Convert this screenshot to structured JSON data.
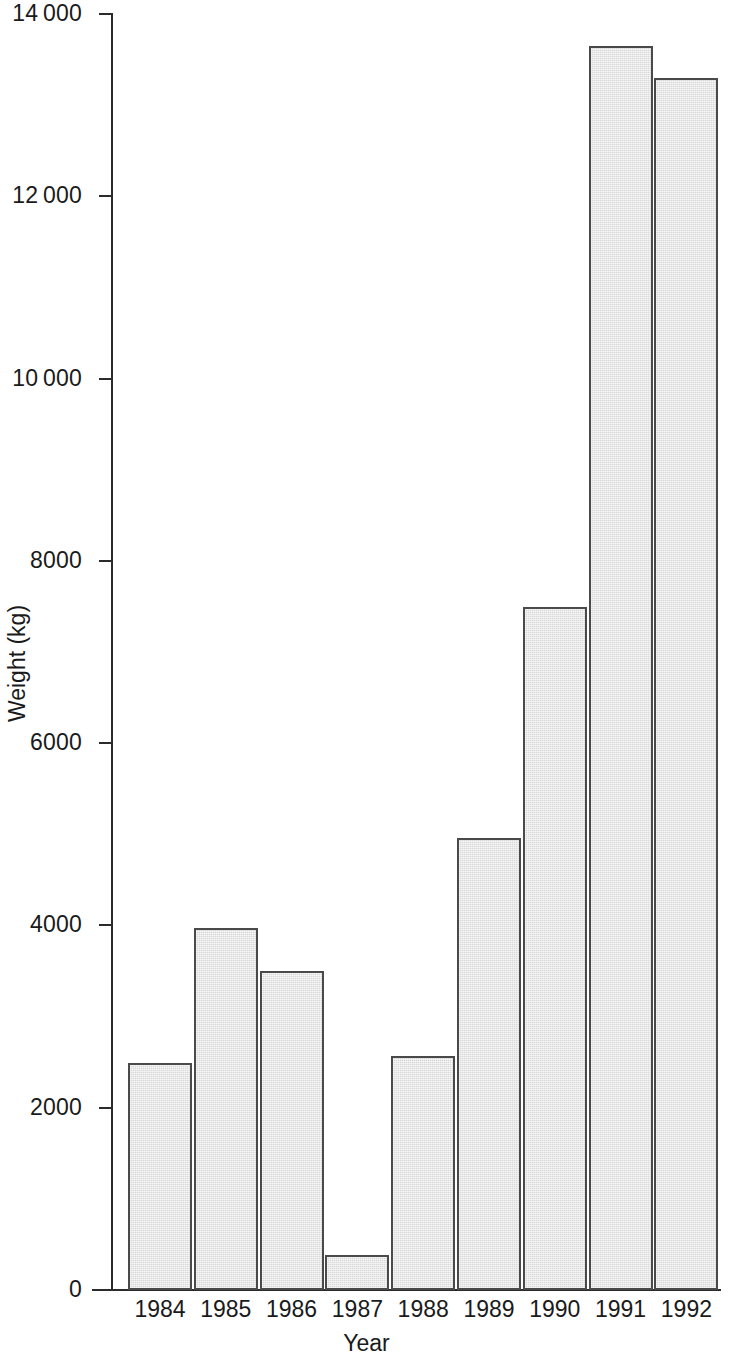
{
  "chart_data": {
    "type": "bar",
    "title": "",
    "subtitle": "",
    "xlabel": "Year",
    "ylabel": "Weight (kg)",
    "categories": [
      "1984",
      "1985",
      "1986",
      "1987",
      "1988",
      "1989",
      "1990",
      "1991",
      "1992"
    ],
    "values": [
      2490,
      3970,
      3500,
      380,
      2570,
      4960,
      7490,
      13650,
      13300
    ],
    "series": [
      {
        "name": "Weight",
        "values": [
          2490,
          3970,
          3500,
          380,
          2570,
          4960,
          7490,
          13650,
          13300
        ]
      }
    ],
    "ylim": [
      0,
      14000
    ],
    "ytick_values": [
      0,
      2000,
      4000,
      6000,
      8000,
      10000,
      12000,
      14000
    ],
    "ytick_labels": [
      "0",
      "2000",
      "4000",
      "6000",
      "8000",
      "10 000",
      "12 000",
      "14 000"
    ],
    "grid": false,
    "legend": null,
    "legend_position": "none",
    "bar_fill_color": "#d8d8d8",
    "bar_edge_color": "#4a4a4a",
    "axis_color": "#2b2b2b",
    "background_color": "#ffffff",
    "annotations": []
  }
}
